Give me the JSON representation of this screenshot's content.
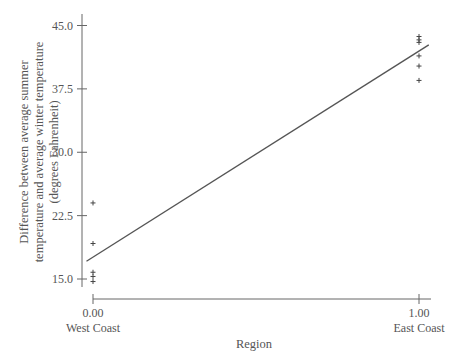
{
  "chart_data": {
    "type": "scatter",
    "title": "",
    "xlabel": "Region",
    "ylabel_lines": [
      "Difference between average summer",
      "temperature and average winter temperature",
      "(degrees Fahrenheit)"
    ],
    "ylabel": "Difference between average summer temperature and average winter temperature (degrees Fahrenheit)",
    "xlim": [
      0,
      1
    ],
    "ylim": [
      15,
      45
    ],
    "yticks": [
      15.0,
      22.5,
      30.0,
      37.5,
      45.0
    ],
    "ytick_labels": [
      "15.0",
      "22.5",
      "30.0",
      "37.5",
      "45.0"
    ],
    "xticks": [
      0,
      1
    ],
    "xtick_labels": [
      "0.00",
      "1.00"
    ],
    "xtick_sublabels": [
      "West Coast",
      "East Coast"
    ],
    "grid": false,
    "legend": null,
    "marker": "+",
    "series": [
      {
        "name": "West Coast",
        "x": [
          0,
          0,
          0,
          0,
          0
        ],
        "y": [
          24.0,
          19.2,
          15.8,
          15.3,
          14.7
        ]
      },
      {
        "name": "East Coast",
        "x": [
          1,
          1,
          1,
          1,
          1,
          1
        ],
        "y": [
          43.7,
          43.3,
          43.0,
          41.4,
          40.2,
          38.5
        ]
      }
    ],
    "regression_line": {
      "x": [
        -0.02,
        1.03
      ],
      "y": [
        17.1,
        42.7
      ]
    }
  }
}
